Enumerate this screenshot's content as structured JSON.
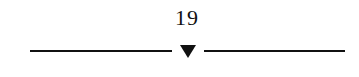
{
  "page": {
    "number": "19"
  },
  "divider": {
    "marker_icon": "down-triangle-icon",
    "color": "#111111"
  }
}
